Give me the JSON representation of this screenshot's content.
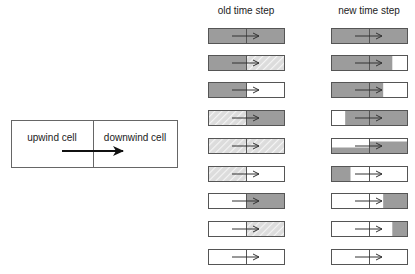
{
  "legend_box": {
    "left_label": "upwind cell",
    "right_label": "downwind cell",
    "arrow": "flow-direction-arrow"
  },
  "columns": {
    "old": {
      "title": "old time step"
    },
    "new": {
      "title": "new time step"
    }
  },
  "colors": {
    "fill": "#9c9c9c",
    "hatch_bg": "#dcdcdc",
    "hatch_line": "#f4f4f4",
    "border": "#555555",
    "empty": "#ffffff"
  },
  "rows": [
    {
      "old": {
        "left": "full",
        "right": "full"
      },
      "new": {
        "segments": [
          [
            0,
            1,
            0,
            1
          ]
        ]
      }
    },
    {
      "old": {
        "left": "full",
        "right": "hatch"
      },
      "new": {
        "segments": [
          [
            0,
            0.8,
            0,
            1
          ]
        ]
      }
    },
    {
      "old": {
        "left": "full",
        "right": "empty"
      },
      "new": {
        "segments": [
          [
            0,
            0.68,
            0,
            1
          ]
        ]
      }
    },
    {
      "old": {
        "left": "hatch",
        "right": "full"
      },
      "new": {
        "segments": [
          [
            0.18,
            1,
            0,
            1
          ]
        ]
      }
    },
    {
      "old": {
        "left": "hatch",
        "right": "hatch"
      },
      "new": {
        "segments": [
          [
            0,
            0.5,
            0.6,
            1
          ],
          [
            0.5,
            1,
            0.2,
            1
          ]
        ]
      }
    },
    {
      "old": {
        "left": "hatch",
        "right": "empty"
      },
      "new": {
        "segments": [
          [
            0,
            0.25,
            0,
            1
          ]
        ]
      }
    },
    {
      "old": {
        "left": "empty",
        "right": "full"
      },
      "new": {
        "segments": [
          [
            0.68,
            1,
            0,
            1
          ]
        ]
      }
    },
    {
      "old": {
        "left": "empty",
        "right": "hatch"
      },
      "new": {
        "segments": [
          [
            0.8,
            1,
            0,
            1
          ]
        ]
      }
    },
    {
      "old": {
        "left": "empty",
        "right": "empty"
      },
      "new": {
        "segments": []
      }
    }
  ]
}
